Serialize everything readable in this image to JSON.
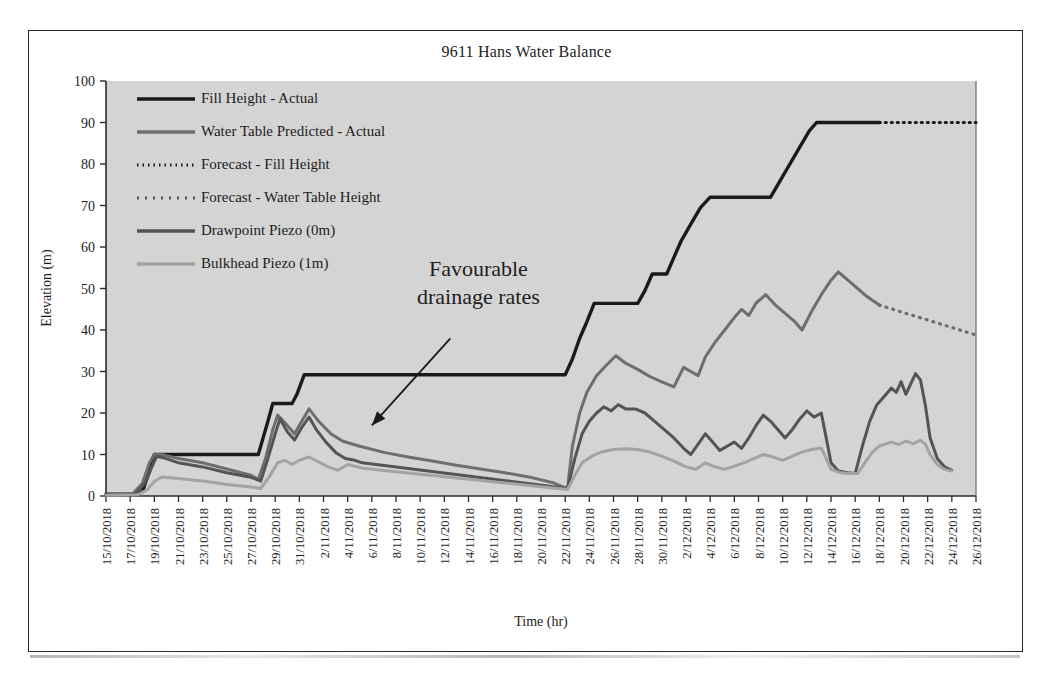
{
  "chart_data": {
    "type": "line",
    "title": "9611 Hans Water Balance",
    "xlabel": "Time (hr)",
    "ylabel": "Elevation (m)",
    "ylim": [
      0,
      100
    ],
    "ytick_step": 10,
    "yticks": [
      0,
      10,
      20,
      30,
      40,
      50,
      60,
      70,
      80,
      90,
      100
    ],
    "grid": false,
    "legend_position": "upper-left-inside",
    "plot_background": "#d4d4d4",
    "xticks": [
      "15/10/2018",
      "17/10/2018",
      "19/10/2018",
      "21/10/2018",
      "23/10/2018",
      "25/10/2018",
      "27/10/2018",
      "29/10/2018",
      "31/10/2018",
      "2/11/2018",
      "4/11/2018",
      "6/11/2018",
      "8/11/2018",
      "10/11/2018",
      "12/11/2018",
      "14/11/2018",
      "16/11/2018",
      "18/11/2018",
      "20/11/2018",
      "22/11/2018",
      "24/11/2018",
      "26/11/2018",
      "28/11/2018",
      "30/11/2018",
      "2/12/2018",
      "4/12/2018",
      "6/12/2018",
      "8/12/2018",
      "10/12/2018",
      "12/12/2018",
      "14/12/2018",
      "16/12/2018",
      "18/12/2018",
      "20/12/2018",
      "22/12/2018",
      "24/12/2018",
      "26/12/2018"
    ],
    "xlim_days": [
      0,
      72
    ],
    "annotations": [
      {
        "name": "favourable-drainage-rates",
        "line1": "Favourable",
        "line2": "drainage rates",
        "text": "Favourable drainage rates",
        "arrow_from_days": 28.5,
        "arrow_from_value": 38,
        "arrow_to_days": 22.0,
        "arrow_to_value": 17
      }
    ],
    "series": [
      {
        "name": "Fill Height - Actual",
        "color": "#1a1a1a",
        "width": 3.4,
        "dash": "none",
        "points": [
          [
            0,
            0.4
          ],
          [
            2.0,
            0.4
          ],
          [
            3.0,
            1.0
          ],
          [
            3.6,
            6.0
          ],
          [
            4.0,
            10.0
          ],
          [
            12.6,
            10.0
          ],
          [
            13.0,
            14.0
          ],
          [
            13.4,
            18.0
          ],
          [
            13.8,
            22.3
          ],
          [
            15.4,
            22.3
          ],
          [
            15.8,
            24.5
          ],
          [
            16.4,
            29.2
          ],
          [
            38.0,
            29.2
          ],
          [
            38.6,
            33.0
          ],
          [
            39.2,
            38.0
          ],
          [
            39.8,
            42.0
          ],
          [
            40.4,
            46.4
          ],
          [
            44.0,
            46.4
          ],
          [
            44.6,
            49.5
          ],
          [
            45.2,
            53.5
          ],
          [
            46.4,
            53.5
          ],
          [
            47.0,
            57.5
          ],
          [
            47.6,
            61.5
          ],
          [
            48.4,
            65.5
          ],
          [
            49.2,
            69.5
          ],
          [
            50.0,
            72.0
          ],
          [
            55.0,
            72.0
          ],
          [
            55.8,
            76.0
          ],
          [
            56.6,
            80.0
          ],
          [
            57.4,
            84.0
          ],
          [
            58.2,
            88.0
          ],
          [
            58.8,
            90.0
          ],
          [
            64.0,
            90.0
          ]
        ]
      },
      {
        "name": "Water Table Predicted - Actual",
        "color": "#6e6e6e",
        "width": 3.0,
        "dash": "none",
        "points": [
          [
            0,
            0.3
          ],
          [
            2.2,
            0.5
          ],
          [
            3.0,
            3.0
          ],
          [
            3.6,
            8.0
          ],
          [
            4.0,
            10.0
          ],
          [
            4.6,
            10.0
          ],
          [
            6.0,
            9.0
          ],
          [
            8.0,
            8.0
          ],
          [
            10.0,
            6.5
          ],
          [
            12.0,
            5.0
          ],
          [
            12.6,
            4.0
          ],
          [
            13.2,
            9.0
          ],
          [
            13.8,
            16.0
          ],
          [
            14.2,
            19.5
          ],
          [
            15.0,
            17.0
          ],
          [
            15.6,
            15.0
          ],
          [
            16.2,
            18.0
          ],
          [
            16.8,
            21.0
          ],
          [
            17.6,
            18.0
          ],
          [
            18.6,
            15.0
          ],
          [
            19.6,
            13.2
          ],
          [
            21.0,
            12.0
          ],
          [
            23.0,
            10.5
          ],
          [
            25.0,
            9.4
          ],
          [
            27.0,
            8.4
          ],
          [
            29.0,
            7.4
          ],
          [
            31.0,
            6.5
          ],
          [
            33.0,
            5.6
          ],
          [
            35.0,
            4.6
          ],
          [
            37.0,
            3.2
          ],
          [
            37.8,
            2.2
          ],
          [
            38.2,
            2.0
          ],
          [
            38.6,
            12.0
          ],
          [
            39.2,
            20.0
          ],
          [
            39.8,
            25.0
          ],
          [
            40.6,
            29.0
          ],
          [
            41.4,
            31.5
          ],
          [
            42.2,
            33.8
          ],
          [
            43.0,
            32.0
          ],
          [
            44.0,
            30.5
          ],
          [
            45.0,
            28.8
          ],
          [
            46.0,
            27.5
          ],
          [
            47.0,
            26.3
          ],
          [
            47.8,
            31.0
          ],
          [
            48.4,
            30.0
          ],
          [
            49.0,
            29.0
          ],
          [
            49.6,
            33.5
          ],
          [
            50.4,
            37.0
          ],
          [
            51.2,
            40.0
          ],
          [
            52.0,
            43.0
          ],
          [
            52.6,
            45.0
          ],
          [
            53.2,
            43.5
          ],
          [
            53.8,
            46.5
          ],
          [
            54.6,
            48.5
          ],
          [
            55.4,
            46.0
          ],
          [
            56.2,
            44.0
          ],
          [
            57.0,
            42.0
          ],
          [
            57.6,
            40.0
          ],
          [
            58.4,
            44.5
          ],
          [
            59.2,
            48.5
          ],
          [
            60.0,
            52.0
          ],
          [
            60.6,
            54.0
          ],
          [
            61.4,
            52.0
          ],
          [
            62.2,
            50.0
          ],
          [
            63.0,
            48.0
          ],
          [
            64.0,
            46.0
          ]
        ]
      },
      {
        "name": "Forecast - Fill Height",
        "color": "#1a1a1a",
        "width": 3.2,
        "dash": "1,5",
        "points": [
          [
            64.0,
            90.0
          ],
          [
            72.0,
            90.0
          ]
        ]
      },
      {
        "name": "Forecast - Water Table Height",
        "color": "#6e6e6e",
        "width": 3.2,
        "dash": "1,6",
        "points": [
          [
            64.0,
            46.0
          ],
          [
            72.0,
            38.8
          ]
        ]
      },
      {
        "name": "Drawpoint Piezo (0m)",
        "color": "#545454",
        "width": 3.0,
        "dash": "none",
        "points": [
          [
            0,
            0.2
          ],
          [
            2.4,
            0.4
          ],
          [
            3.2,
            3.0
          ],
          [
            3.8,
            7.0
          ],
          [
            4.2,
            9.6
          ],
          [
            5.0,
            9.0
          ],
          [
            6.0,
            8.0
          ],
          [
            8.0,
            7.0
          ],
          [
            10.0,
            5.6
          ],
          [
            12.0,
            4.5
          ],
          [
            12.8,
            3.6
          ],
          [
            13.4,
            9.0
          ],
          [
            14.0,
            15.0
          ],
          [
            14.4,
            18.6
          ],
          [
            15.0,
            15.5
          ],
          [
            15.6,
            13.5
          ],
          [
            16.2,
            16.5
          ],
          [
            16.8,
            19.0
          ],
          [
            17.4,
            16.0
          ],
          [
            18.2,
            13.0
          ],
          [
            19.0,
            10.5
          ],
          [
            19.8,
            9.0
          ],
          [
            20.6,
            8.6
          ],
          [
            21.2,
            8.0
          ],
          [
            38.2,
            1.8
          ],
          [
            38.8,
            9.0
          ],
          [
            39.4,
            15.0
          ],
          [
            40.0,
            18.0
          ],
          [
            40.6,
            20.0
          ],
          [
            41.2,
            21.5
          ],
          [
            41.8,
            20.5
          ],
          [
            42.4,
            22.0
          ],
          [
            43.0,
            21.0
          ],
          [
            43.8,
            21.0
          ],
          [
            44.6,
            20.0
          ],
          [
            45.4,
            18.0
          ],
          [
            46.2,
            16.0
          ],
          [
            47.0,
            14.0
          ],
          [
            47.8,
            11.5
          ],
          [
            48.4,
            10.0
          ],
          [
            49.0,
            12.5
          ],
          [
            49.6,
            15.0
          ],
          [
            50.2,
            13.0
          ],
          [
            50.8,
            11.0
          ],
          [
            51.4,
            12.0
          ],
          [
            52.0,
            13.0
          ],
          [
            52.6,
            11.5
          ],
          [
            53.2,
            14.0
          ],
          [
            53.8,
            17.0
          ],
          [
            54.4,
            19.5
          ],
          [
            55.0,
            18.0
          ],
          [
            55.6,
            16.0
          ],
          [
            56.2,
            14.0
          ],
          [
            56.8,
            16.0
          ],
          [
            57.4,
            18.5
          ],
          [
            58.0,
            20.5
          ],
          [
            58.6,
            19.0
          ],
          [
            59.2,
            20.0
          ],
          [
            59.6,
            14.0
          ],
          [
            60.0,
            8.0
          ],
          [
            60.6,
            6.0
          ],
          [
            61.4,
            5.6
          ],
          [
            62.0,
            5.4
          ],
          [
            62.6,
            12.0
          ],
          [
            63.2,
            18.0
          ],
          [
            63.8,
            22.0
          ],
          [
            64.4,
            24.0
          ],
          [
            65.0,
            26.0
          ],
          [
            65.4,
            25.0
          ],
          [
            65.8,
            27.5
          ],
          [
            66.2,
            24.5
          ],
          [
            66.6,
            27.0
          ],
          [
            67.0,
            29.5
          ],
          [
            67.4,
            28.0
          ],
          [
            67.8,
            22.0
          ],
          [
            68.2,
            14.0
          ],
          [
            68.8,
            9.0
          ],
          [
            69.4,
            7.0
          ],
          [
            70.0,
            6.2
          ]
        ]
      },
      {
        "name": "Bulkhead Piezo (1m)",
        "color": "#a3a3a3",
        "width": 3.0,
        "dash": "none",
        "points": [
          [
            0,
            0.2
          ],
          [
            2.6,
            0.3
          ],
          [
            3.4,
            1.5
          ],
          [
            4.0,
            3.5
          ],
          [
            4.6,
            4.6
          ],
          [
            6.0,
            4.2
          ],
          [
            8.0,
            3.6
          ],
          [
            10.0,
            2.8
          ],
          [
            12.0,
            2.2
          ],
          [
            12.8,
            1.8
          ],
          [
            13.6,
            5.0
          ],
          [
            14.2,
            8.0
          ],
          [
            14.8,
            8.6
          ],
          [
            15.4,
            7.6
          ],
          [
            16.0,
            8.6
          ],
          [
            16.8,
            9.4
          ],
          [
            17.6,
            8.2
          ],
          [
            18.4,
            7.0
          ],
          [
            19.2,
            6.2
          ],
          [
            20.0,
            7.6
          ],
          [
            20.8,
            7.0
          ],
          [
            21.4,
            6.6
          ],
          [
            38.2,
            1.6
          ],
          [
            38.8,
            5.0
          ],
          [
            39.4,
            8.0
          ],
          [
            40.2,
            9.6
          ],
          [
            41.0,
            10.6
          ],
          [
            42.0,
            11.2
          ],
          [
            43.0,
            11.4
          ],
          [
            44.0,
            11.2
          ],
          [
            45.0,
            10.6
          ],
          [
            46.0,
            9.6
          ],
          [
            47.0,
            8.4
          ],
          [
            48.0,
            7.0
          ],
          [
            48.8,
            6.4
          ],
          [
            49.6,
            8.0
          ],
          [
            50.4,
            7.0
          ],
          [
            51.2,
            6.4
          ],
          [
            52.0,
            7.2
          ],
          [
            52.8,
            8.0
          ],
          [
            53.6,
            9.0
          ],
          [
            54.4,
            10.0
          ],
          [
            55.2,
            9.4
          ],
          [
            56.0,
            8.6
          ],
          [
            56.8,
            9.6
          ],
          [
            57.6,
            10.6
          ],
          [
            58.4,
            11.2
          ],
          [
            59.2,
            11.6
          ],
          [
            59.6,
            9.0
          ],
          [
            60.0,
            6.4
          ],
          [
            60.8,
            5.6
          ],
          [
            61.6,
            5.4
          ],
          [
            62.2,
            5.4
          ],
          [
            62.8,
            8.0
          ],
          [
            63.4,
            10.5
          ],
          [
            64.0,
            12.0
          ],
          [
            65.0,
            13.0
          ],
          [
            65.6,
            12.4
          ],
          [
            66.2,
            13.2
          ],
          [
            66.8,
            12.6
          ],
          [
            67.4,
            13.4
          ],
          [
            67.8,
            12.5
          ],
          [
            68.2,
            10.0
          ],
          [
            68.8,
            7.6
          ],
          [
            69.4,
            6.4
          ],
          [
            70.0,
            6.0
          ]
        ]
      }
    ],
    "legend_entries": [
      {
        "label": "Fill Height - Actual",
        "color": "#1a1a1a",
        "dash": "none",
        "width": 3.6
      },
      {
        "label": "Water Table Predicted - Actual",
        "color": "#6e6e6e",
        "dash": "none",
        "width": 3.4
      },
      {
        "label": "Forecast - Fill Height",
        "color": "#1a1a1a",
        "dash": "1.5,4",
        "width": 3.0
      },
      {
        "label": "Forecast - Water Table Height",
        "color": "#555555",
        "dash": "2,6",
        "width": 3.2
      },
      {
        "label": "Drawpoint Piezo (0m)",
        "color": "#545454",
        "dash": "none",
        "width": 3.4
      },
      {
        "label": "Bulkhead Piezo (1m)",
        "color": "#a3a3a3",
        "dash": "none",
        "width": 3.4
      }
    ]
  }
}
